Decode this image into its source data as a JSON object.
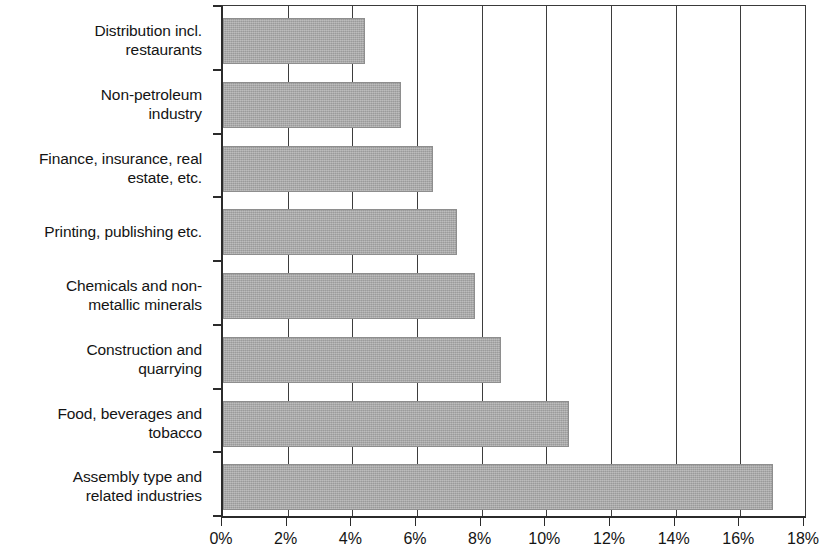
{
  "chart_data": {
    "type": "bar",
    "orientation": "horizontal",
    "title": "",
    "subtitle": "",
    "xlabel": "",
    "ylabel": "",
    "categories": [
      "Distribution incl.\nrestaurants",
      "Non-petroleum\nindustry",
      "Finance, insurance, real\nestate, etc.",
      "Printing, publishing etc.",
      "Chemicals and non-\nmetallic minerals",
      "Construction and\nquarrying",
      "Food, beverages and\ntobacco",
      "Assembly type and\nrelated industries"
    ],
    "values": [
      4.4,
      5.5,
      6.5,
      7.25,
      7.8,
      8.6,
      10.7,
      17.0
    ],
    "value_labels": [
      "4.4%",
      "5.5%",
      "6.5%",
      "7.25%",
      "7.8%",
      "8.6%",
      "10.7%",
      "17.0%"
    ],
    "xlim": [
      0,
      18
    ],
    "x_ticks": [
      0,
      2,
      4,
      6,
      8,
      10,
      12,
      14,
      16,
      18
    ],
    "x_tick_labels": [
      "0%",
      "2%",
      "4%",
      "6%",
      "8%",
      "10%",
      "12%",
      "14%",
      "16%",
      "18%"
    ],
    "grid": true,
    "grid_axis": "x",
    "legend": false,
    "legend_position": "none",
    "series": [
      {
        "name": "",
        "values": [
          4.4,
          5.5,
          6.5,
          7.25,
          7.8,
          8.6,
          10.7,
          17.0
        ]
      }
    ],
    "colors": {
      "bar_fill": "#a9a9a9",
      "bar_border": "#8e8e8e",
      "gridline": "#3d3d3d",
      "axis": "#2b2b2b",
      "text": "#141414",
      "background": "#ffffff"
    }
  }
}
